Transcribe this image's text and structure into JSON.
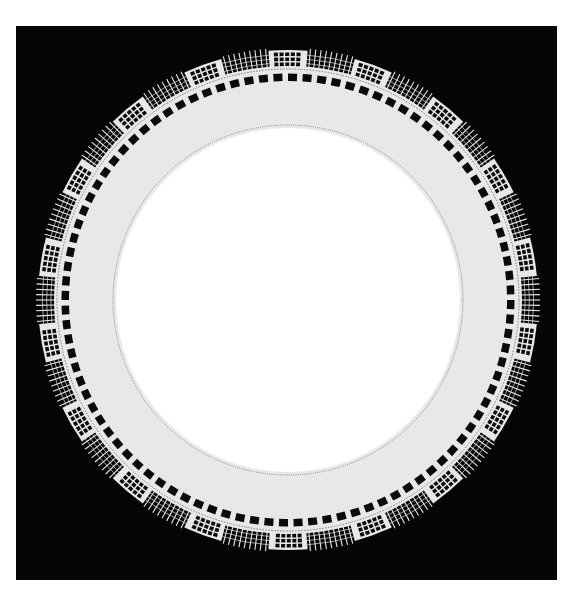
{
  "scene": {
    "subject": "circular bobbin-lace doily ring on black background",
    "background_color": "#050505",
    "page_color": "#ffffff",
    "photo_rect": {
      "x": 16,
      "y": 26,
      "w": 541,
      "h": 554
    }
  },
  "lace": {
    "center": {
      "x": 288,
      "y": 300
    },
    "inner_disc_radius": 172,
    "inner_disc_color": "#ffffff",
    "thread_color": "#e8e8e8",
    "grey_band_color": "#b9b9b9",
    "dark_color": "#0a0a0a",
    "bands": {
      "picot_edge_r": 174,
      "inner_square_row": {
        "r0": 177,
        "r1": 189,
        "count": 84
      },
      "checker_band": {
        "r0": 190,
        "r1": 216,
        "cells": 36,
        "rows": 3
      },
      "outer_square_row": {
        "r0": 217,
        "r1": 228,
        "count": 96
      },
      "dotted_line_r": 231
    },
    "border": {
      "block_count": 18,
      "block_r0": 233,
      "block_r1": 250,
      "block_span_deg": 9,
      "fringe_r1": 252,
      "fringe_spikes_per_gap": 9,
      "start_angle_deg": 0
    }
  }
}
